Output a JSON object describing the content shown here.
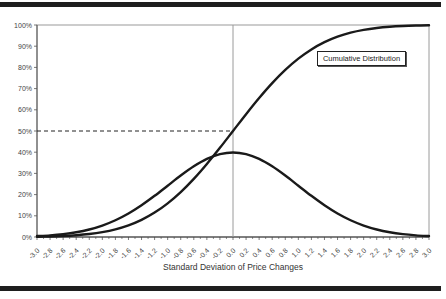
{
  "chart_data": {
    "type": "line",
    "title": "",
    "legend": [
      "Cumulative Distribution"
    ],
    "legend_position": "upper-right-inside",
    "xlabel": "Standard Deviation of Price Changes",
    "ylabel": "",
    "xlim": [
      -3.0,
      3.0
    ],
    "ylim": [
      0,
      1.0
    ],
    "grid": false,
    "x_tick_labels": [
      "-3.0",
      "-2.8",
      "-2.6",
      "-2.4",
      "-2.2",
      "-2.0",
      "-1.8",
      "-1.6",
      "-1.4",
      "-1.2",
      "-1.0",
      "-0.8",
      "-0.6",
      "-0.4",
      "-0.2",
      "0.0",
      "0.2",
      "0.4",
      "0.6",
      "0.8",
      "1.0",
      "1.2",
      "1.4",
      "1.6",
      "1.8",
      "2.0",
      "2.2",
      "2.4",
      "2.6",
      "2.8",
      "3.0"
    ],
    "y_tick_labels": [
      "0%",
      "10%",
      "20%",
      "30%",
      "40%",
      "50%",
      "60%",
      "70%",
      "80%",
      "90%",
      "100%"
    ],
    "x": [
      -3.0,
      -2.8,
      -2.6,
      -2.4,
      -2.2,
      -2.0,
      -1.8,
      -1.6,
      -1.4,
      -1.2,
      -1.0,
      -0.8,
      -0.6,
      -0.4,
      -0.2,
      0.0,
      0.2,
      0.4,
      0.6,
      0.8,
      1.0,
      1.2,
      1.4,
      1.6,
      1.8,
      2.0,
      2.2,
      2.4,
      2.6,
      2.8,
      3.0
    ],
    "series": [
      {
        "name": "Cumulative Distribution",
        "values": [
          0.0013,
          0.0026,
          0.0047,
          0.0082,
          0.0139,
          0.0228,
          0.0359,
          0.0548,
          0.0808,
          0.1151,
          0.1587,
          0.2119,
          0.2743,
          0.3446,
          0.4207,
          0.5,
          0.5793,
          0.6554,
          0.7257,
          0.7881,
          0.8413,
          0.8849,
          0.9192,
          0.9452,
          0.9641,
          0.9772,
          0.9861,
          0.9918,
          0.9953,
          0.9974,
          0.9987
        ]
      },
      {
        "name": "Normal Density",
        "values": [
          0.0044,
          0.0079,
          0.0136,
          0.0224,
          0.0355,
          0.054,
          0.079,
          0.1109,
          0.1497,
          0.1942,
          0.242,
          0.2897,
          0.3332,
          0.3683,
          0.391,
          0.3989,
          0.391,
          0.3683,
          0.3332,
          0.2897,
          0.242,
          0.1942,
          0.1497,
          0.1109,
          0.079,
          0.054,
          0.0355,
          0.0224,
          0.0136,
          0.0079,
          0.0044
        ]
      }
    ],
    "annotations": [
      {
        "type": "hline-dashed",
        "y": 0.5,
        "x_from": -3.0,
        "x_to": 0.0
      },
      {
        "type": "vline",
        "x": 0.0
      }
    ]
  },
  "page": {
    "legend_label": "Cumulative Distribution",
    "xaxis_title": "Standard Deviation of Price Changes"
  }
}
